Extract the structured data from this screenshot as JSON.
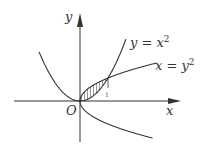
{
  "diagram": {
    "type": "function-graph",
    "axes": {
      "x_label": "x",
      "y_label": "y",
      "origin_label": "O"
    },
    "curves": [
      {
        "name": "parabola-up",
        "equation_lhs": "y = x",
        "exponent": "2",
        "label": "y = x²"
      },
      {
        "name": "parabola-right",
        "equation_lhs": "x = y",
        "exponent": "2",
        "label": "x = y²"
      }
    ],
    "shaded_region": {
      "description": "region between y = x² and x = y² for 0 ≤ x ≤ 1",
      "fill": "hatched"
    },
    "tick_label": "1",
    "colors": {
      "line": "#333333",
      "background": "#ffffff"
    }
  }
}
